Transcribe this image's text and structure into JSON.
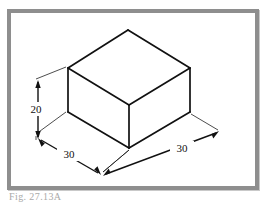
{
  "figure": {
    "caption": "Fig. 27.13A",
    "border_color": "#8e8e8e",
    "line_color": "#111111",
    "background": "#ffffff",
    "alt_description": "Isometric drawing of a rectangular box with dimensions"
  },
  "drawing": {
    "title": "Isometric box",
    "dimensions": [
      {
        "id": "height",
        "label": "20",
        "orientation": "vertical",
        "side": "left"
      },
      {
        "id": "depth",
        "label": "30",
        "orientation": "isometric-left",
        "side": "bottom-left"
      },
      {
        "id": "width",
        "label": "30",
        "orientation": "isometric-right",
        "side": "bottom-right"
      }
    ],
    "labels": {
      "height": "20",
      "depth": "30",
      "width": "30"
    }
  }
}
